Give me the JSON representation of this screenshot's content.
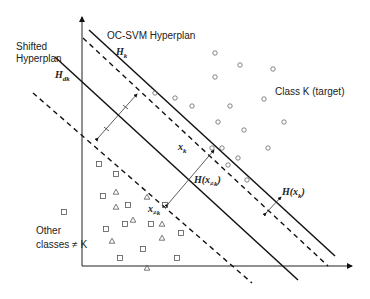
{
  "labels": {
    "oc_svm": "OC-SVM Hyperplan",
    "shifted_line1": "Shifted",
    "shifted_line2": "Hyperplan",
    "class_k": "Class K  (target)",
    "other_line1": "Other",
    "other_line2": "classes ≠ K"
  },
  "math": {
    "hk_main": "H",
    "hk_sub": "k",
    "hdk_main": "H",
    "hdk_sub": "dk",
    "xk_main": "x",
    "xk_sup": "–",
    "xk_sub": "k",
    "xnk_main": "x",
    "xnk_sup": "–",
    "xnk_sub": "≠k",
    "h_xnk": "H(x",
    "h_xnk_sub": "≠k",
    "h_xnk_close": ")",
    "h_xk": "H(x",
    "h_xk_sub": "k",
    "h_xk_close": ")"
  },
  "colors": {
    "line": "#111111",
    "marker": "#555555"
  },
  "points": {
    "circles": [
      [
        215,
        53
      ],
      [
        240,
        65
      ],
      [
        215,
        77
      ],
      [
        273,
        69
      ],
      [
        264,
        99
      ],
      [
        192,
        106
      ],
      [
        230,
        106
      ],
      [
        218,
        122
      ],
      [
        284,
        122
      ],
      [
        244,
        130
      ],
      [
        175,
        98
      ],
      [
        155,
        93
      ],
      [
        212,
        148
      ],
      [
        222,
        148
      ],
      [
        268,
        148
      ],
      [
        238,
        158
      ],
      [
        228,
        165
      ],
      [
        247,
        180
      ]
    ],
    "squares": [
      [
        99,
        164
      ],
      [
        116,
        174
      ],
      [
        103,
        196
      ],
      [
        128,
        205
      ],
      [
        125,
        224
      ],
      [
        106,
        229
      ],
      [
        151,
        224
      ],
      [
        181,
        233
      ],
      [
        143,
        249
      ],
      [
        120,
        258
      ],
      [
        177,
        258
      ],
      [
        165,
        205
      ],
      [
        64,
        212
      ]
    ],
    "triangles": [
      [
        116,
        192
      ],
      [
        116,
        207
      ],
      [
        133,
        220
      ],
      [
        147,
        197
      ],
      [
        162,
        224
      ],
      [
        162,
        238
      ],
      [
        112,
        241
      ],
      [
        147,
        268
      ]
    ]
  }
}
